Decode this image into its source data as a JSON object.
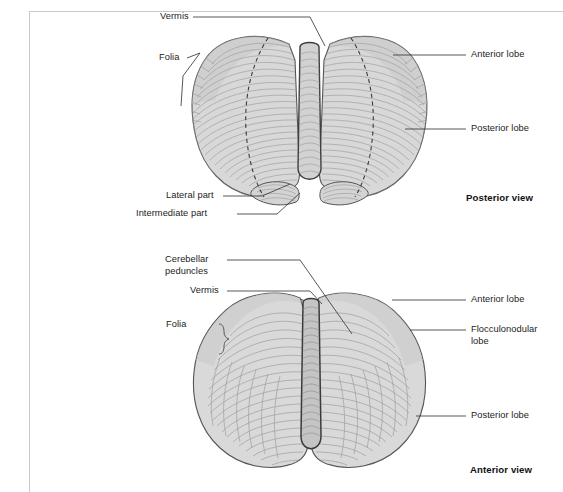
{
  "figure": {
    "background_color": "#ffffff",
    "frame_color": "#c9c9c9",
    "text_color": "#1d1d1d",
    "leader_line_color": "#3a3a3a",
    "outline_color": "#4a4a4a",
    "fill_light": "#dcdcdc",
    "fill_mid": "#cfcfcf",
    "fill_dark": "#b4b4b4",
    "folia_line_color": "#9a9a9a",
    "dashed_line_color": "#3a3a3a"
  },
  "panels": [
    {
      "id": "posterior",
      "caption": "Posterior view",
      "labels": [
        {
          "name": "vermis",
          "text": "Vermis"
        },
        {
          "name": "folia",
          "text": "Folia"
        },
        {
          "name": "anterior-lobe",
          "text": "Anterior lobe"
        },
        {
          "name": "posterior-lobe",
          "text": "Posterior lobe"
        },
        {
          "name": "lateral-part",
          "text": "Lateral part"
        },
        {
          "name": "intermediate-part",
          "text": "Intermediate part"
        }
      ]
    },
    {
      "id": "anterior",
      "caption": "Anterior view",
      "labels": [
        {
          "name": "cerebellar-peduncles",
          "text": "Cerebellar",
          "text2": "peduncles"
        },
        {
          "name": "vermis",
          "text": "Vermis"
        },
        {
          "name": "folia",
          "text": "Folia"
        },
        {
          "name": "anterior-lobe",
          "text": "Anterior lobe"
        },
        {
          "name": "flocculonodular-lobe",
          "text": "Flocculonodular lobe"
        },
        {
          "name": "posterior-lobe",
          "text": "Posterior lobe"
        }
      ]
    }
  ]
}
